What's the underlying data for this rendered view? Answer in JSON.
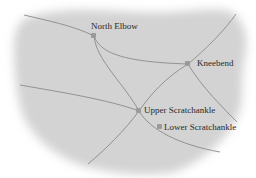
{
  "map": {
    "land_color": "#d3d3d3",
    "road_color": "#8a8a8a",
    "marker_color": "#9a9a9a",
    "label_color": "#2a2a2a",
    "places": [
      {
        "name": "North Elbow",
        "x": 94,
        "y": 36
      },
      {
        "name": "Kneebend",
        "x": 188,
        "y": 64
      },
      {
        "name": "Upper Scratchankle",
        "x": 139,
        "y": 111
      },
      {
        "name": "Lower Scratchankle",
        "x": 160,
        "y": 127
      }
    ]
  }
}
